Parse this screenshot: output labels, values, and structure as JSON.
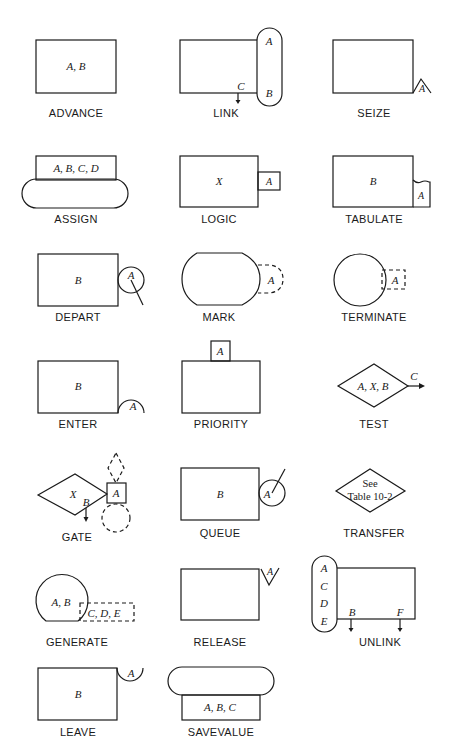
{
  "diagram": {
    "type": "GPSS block symbols",
    "blocks": [
      {
        "name": "ADVANCE",
        "operands": "A, B"
      },
      {
        "name": "LINK",
        "operands": [
          "A",
          "B",
          "C"
        ]
      },
      {
        "name": "SEIZE",
        "operands": [
          "A"
        ]
      },
      {
        "name": "ASSIGN",
        "operands": "A, B, C, D"
      },
      {
        "name": "LOGIC",
        "operands": [
          "X",
          "A"
        ]
      },
      {
        "name": "TABULATE",
        "operands": [
          "B",
          "A"
        ]
      },
      {
        "name": "DEPART",
        "operands": [
          "B",
          "A"
        ]
      },
      {
        "name": "MARK",
        "operands": [
          "A"
        ]
      },
      {
        "name": "TERMINATE",
        "operands": [
          "A"
        ]
      },
      {
        "name": "ENTER",
        "operands": [
          "B",
          "A"
        ]
      },
      {
        "name": "PRIORITY",
        "operands": [
          "A"
        ]
      },
      {
        "name": "TEST",
        "operands": "A, X, B",
        "exit": "C"
      },
      {
        "name": "GATE",
        "operands": [
          "X",
          "A",
          "B"
        ]
      },
      {
        "name": "QUEUE",
        "operands": [
          "B",
          "A"
        ]
      },
      {
        "name": "TRANSFER",
        "note_line1": "See",
        "note_line2": "Table 10-2"
      },
      {
        "name": "GENERATE",
        "operands": "A, B",
        "extra": "C, D, E"
      },
      {
        "name": "RELEASE",
        "operands": [
          "A"
        ]
      },
      {
        "name": "UNLINK",
        "operands": [
          "A",
          "C",
          "D",
          "E",
          "B",
          "F"
        ]
      },
      {
        "name": "LEAVE",
        "operands": [
          "B",
          "A"
        ]
      },
      {
        "name": "SAVEVALUE",
        "operands": "A, B, C"
      }
    ]
  }
}
